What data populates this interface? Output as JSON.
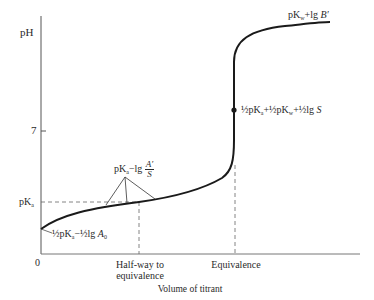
{
  "diagram": {
    "axes": {
      "y_label": "pH",
      "y_tick_7": "7",
      "y_tick_pka": "pK",
      "y_tick_pka_sub": "a",
      "origin": "0",
      "x_label": "Volume of titrant",
      "x_tick_half": "Half-way to",
      "x_tick_half_line2": "equivalence",
      "x_tick_equiv": "Equivalence"
    },
    "annotations": {
      "start": {
        "prefix": "½pK",
        "sub": "a",
        "middle": "−½lg ",
        "var": "A",
        "var_sub": "0"
      },
      "buffer": {
        "prefix": "pK",
        "sub": "a",
        "middle": "−lg ",
        "num": "A′",
        "den": "S"
      },
      "equivalence": {
        "p1": "½pK",
        "s1": "a",
        "p2": "+½pK",
        "s2": "w",
        "p3": "+½lg ",
        "var": "S"
      },
      "end": {
        "p1": "pK",
        "s1": "w",
        "p2": "+lg ",
        "var": "B′"
      }
    },
    "colors": {
      "line": "#1a1a1a",
      "axis": "#555555",
      "dashed": "#666666",
      "text": "#2a2a2a"
    }
  }
}
